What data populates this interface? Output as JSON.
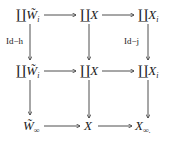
{
  "diagram": {
    "type": "commutative-diagram",
    "nodes": {
      "r1c1": {
        "coprod": "∐",
        "base": "W̃",
        "sub": "i"
      },
      "r1c2": {
        "coprod": "∐",
        "base": "X",
        "sub": ""
      },
      "r1c3": {
        "coprod": "∐",
        "base": "X",
        "sub": "i"
      },
      "r2c1": {
        "coprod": "∐",
        "base": "W̃",
        "sub": "i"
      },
      "r2c2": {
        "coprod": "∐",
        "base": "X",
        "sub": ""
      },
      "r2c3": {
        "coprod": "∐",
        "base": "X",
        "sub": "i"
      },
      "r3c1": {
        "coprod": "",
        "base": "W̃",
        "sub": "∞"
      },
      "r3c2": {
        "coprod": "",
        "base": "X",
        "sub": ""
      },
      "r3c3": {
        "coprod": "",
        "base": "X",
        "sub": "∞."
      }
    },
    "labels": {
      "left_vertical_top": "Id−h",
      "right_vertical_top": "Id−j"
    },
    "edges": [
      {
        "from": "r1c1",
        "to": "r1c2"
      },
      {
        "from": "r1c2",
        "to": "r1c3"
      },
      {
        "from": "r2c1",
        "to": "r2c2"
      },
      {
        "from": "r2c2",
        "to": "r2c3"
      },
      {
        "from": "r3c1",
        "to": "r3c2"
      },
      {
        "from": "r3c2",
        "to": "r3c3"
      },
      {
        "from": "r1c1",
        "to": "r2c1",
        "label": "Id−h"
      },
      {
        "from": "r1c2",
        "to": "r2c2"
      },
      {
        "from": "r1c3",
        "to": "r2c3",
        "label": "Id−j"
      },
      {
        "from": "r2c1",
        "to": "r3c1"
      },
      {
        "from": "r2c2",
        "to": "r3c2"
      },
      {
        "from": "r2c3",
        "to": "r3c3"
      }
    ]
  }
}
